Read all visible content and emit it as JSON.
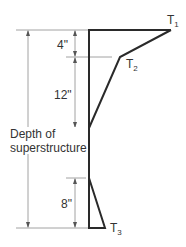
{
  "diagram": {
    "type": "temperature-gradient",
    "colors": {
      "profile_line": "#2a2a2a",
      "dimension_line": "#8a8a8a",
      "text": "#333333",
      "background": "#ffffff"
    },
    "labels": {
      "t1": {
        "main": "T",
        "sub": "1"
      },
      "t2": {
        "main": "T",
        "sub": "2"
      },
      "t3": {
        "main": "T",
        "sub": "3"
      }
    },
    "dimensions": {
      "top_segment": "4\"",
      "middle_segment": "12\"",
      "bottom_segment": "8\"",
      "overall_line1": "Depth of",
      "overall_line2": "superstructure"
    }
  }
}
